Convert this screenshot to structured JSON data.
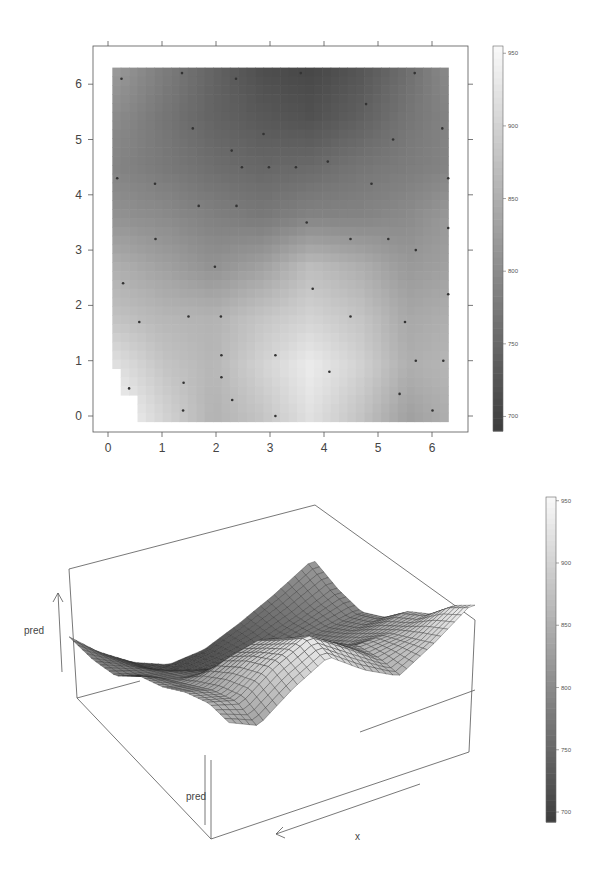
{
  "chart_data": [
    {
      "type": "heatmap",
      "title": "",
      "xlabel": "",
      "ylabel": "",
      "xlim": [
        -0.3,
        6.6
      ],
      "ylim": [
        -0.3,
        6.6
      ],
      "x_ticks": [
        0,
        1,
        2,
        3,
        4,
        5,
        6
      ],
      "y_ticks": [
        0,
        1,
        2,
        3,
        4,
        5,
        6
      ],
      "x_tick_labels": [
        "0",
        "1",
        "2",
        "3",
        "4",
        "5",
        "6"
      ],
      "y_tick_labels": [
        "0",
        "1",
        "2",
        "3",
        "4",
        "5",
        "6"
      ],
      "grid": false,
      "colorbar": {
        "range": [
          690,
          955
        ],
        "ticks": [
          700,
          750,
          800,
          850,
          900,
          950
        ],
        "tick_labels": [
          "700",
          "750",
          "800",
          "850",
          "900",
          "950"
        ],
        "colormap": "grayscale (dark=low, light=high)",
        "position": "right"
      },
      "field_description": "Interpolated predicted surface on [0,6.3]x[0,6.3]: darkest (~700-720) near top-centre (x≈3.5, y≈6); lightest (~930-950) near bottom (x≈0.3-0.6,y≈0.3 and x≈3.5-4.5,y≈0.5-1.2); mid-grey ~800-850 across middle band.",
      "field_samples": {
        "x": [
          0.15,
          1.05,
          1.95,
          2.85,
          3.75,
          4.65,
          5.55,
          6.3
        ],
        "y": [
          6.3,
          5.4,
          4.5,
          3.6,
          2.7,
          1.8,
          0.9,
          0.0
        ],
        "z": [
          [
            820,
            780,
            745,
            715,
            705,
            725,
            760,
            800
          ],
          [
            800,
            770,
            745,
            730,
            720,
            740,
            770,
            790
          ],
          [
            790,
            775,
            760,
            750,
            755,
            770,
            780,
            790
          ],
          [
            810,
            800,
            785,
            775,
            790,
            790,
            800,
            820
          ],
          [
            850,
            830,
            810,
            830,
            870,
            850,
            820,
            830
          ],
          [
            875,
            860,
            855,
            880,
            900,
            880,
            840,
            850
          ],
          [
            920,
            880,
            860,
            900,
            935,
            900,
            850,
            860
          ],
          [
            950,
            900,
            855,
            880,
            920,
            880,
            830,
            850
          ]
        ]
      },
      "points": {
        "x": [
          0.25,
          1.37,
          2.37,
          3.57,
          5.68,
          4.78,
          1.57,
          2.88,
          6.19,
          5.28,
          2.29,
          2.48,
          2.98,
          3.48,
          4.07,
          0.17,
          0.87,
          4.88,
          6.3,
          1.68,
          2.38,
          3.68,
          6.3,
          0.88,
          4.49,
          5.19,
          5.7,
          1.98,
          0.28,
          3.79,
          6.3,
          1.49,
          2.09,
          4.49,
          5.5,
          0.58,
          2.1,
          3.1,
          5.7,
          6.21,
          4.1,
          2.1,
          1.4,
          0.39,
          5.4,
          2.3,
          1.39,
          6.01,
          3.1
        ],
        "y": [
          6.1,
          6.2,
          6.1,
          6.2,
          6.2,
          5.64,
          5.2,
          5.1,
          5.2,
          5.0,
          4.8,
          4.5,
          4.5,
          4.5,
          4.6,
          4.3,
          4.2,
          4.2,
          4.3,
          3.8,
          3.8,
          3.5,
          3.4,
          3.2,
          3.2,
          3.2,
          3.0,
          2.7,
          2.4,
          2.3,
          2.2,
          1.8,
          1.8,
          1.8,
          1.7,
          1.7,
          1.1,
          1.1,
          1.0,
          1.0,
          0.8,
          0.7,
          0.6,
          0.5,
          0.4,
          0.29,
          0.1,
          0.1,
          0.0
        ],
        "marker": "small dark dot"
      }
    },
    {
      "type": "surface3d",
      "title": "",
      "axis_labels": {
        "vertical": "pred",
        "front_vertical": "pred",
        "bottom": "x"
      },
      "zlim": [
        690,
        955
      ],
      "colorbar": {
        "range": [
          690,
          955
        ],
        "ticks": [
          700,
          750,
          800,
          850,
          900,
          950
        ],
        "tick_labels": [
          "700",
          "750",
          "800",
          "850",
          "900",
          "950"
        ],
        "colormap": "grayscale (dark=low, light=high)",
        "position": "right"
      },
      "description": "Wireframe-shaded perspective plot of the same predicted field (pred vs x,y) with ~40x40 mesh; high ridge at back corner, trough at front corner."
    }
  ],
  "labels": {
    "pred_side": "pred",
    "pred_front": "pred",
    "x_axis": "x"
  }
}
